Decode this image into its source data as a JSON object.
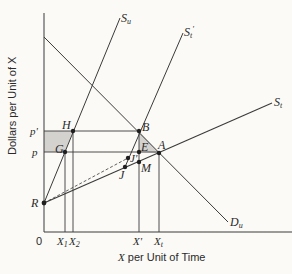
{
  "diagram": {
    "axes": {
      "y_label": "Dollars per Unit of X",
      "x_label_var": "X",
      "x_label_rest": " per Unit of Time",
      "origin": "0"
    },
    "y_ticks": [
      {
        "label": "p'",
        "y": 131
      },
      {
        "label": "p",
        "y": 152
      }
    ],
    "x_ticks": [
      {
        "base": "X",
        "sub": "1",
        "x": 65
      },
      {
        "base": "X",
        "sub": "2",
        "x": 73
      },
      {
        "base": "X'",
        "sub": "",
        "x": 139
      },
      {
        "base": "X",
        "sub": "t",
        "x": 159
      }
    ],
    "curves": {
      "Su": {
        "base": "S",
        "sub": "u"
      },
      "St_prime": {
        "base": "S",
        "sub": "t",
        "sup": "'"
      },
      "St": {
        "base": "S",
        "sub": "t"
      },
      "Du": {
        "base": "D",
        "sub": "u"
      }
    },
    "points": {
      "H": "H",
      "G": "G",
      "B": "B",
      "E": "E",
      "A": "A",
      "J_prime": "J'",
      "J": "J",
      "M": "M",
      "R": "R"
    },
    "colors": {
      "line": "#3a3a3a",
      "shade": "#d4d2cf",
      "background": "#fbfaf7"
    }
  }
}
